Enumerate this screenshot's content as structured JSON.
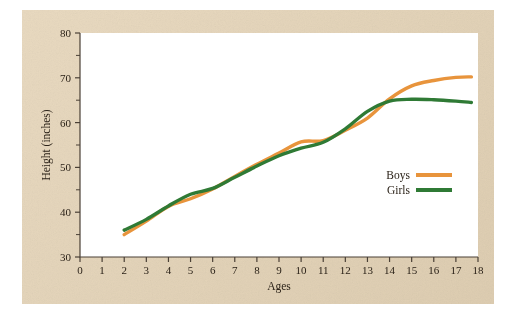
{
  "figure": {
    "panel_color": "#e6d5b8",
    "plot_background": "#ffffff",
    "axis_color": "#4a4036"
  },
  "chart_data": {
    "type": "line",
    "title": "",
    "subtitle": "",
    "xlabel": "Ages",
    "ylabel": "Height (inches)",
    "xlim": [
      0,
      18
    ],
    "ylim": [
      30,
      80
    ],
    "xticks": [
      0,
      1,
      2,
      3,
      4,
      5,
      6,
      7,
      8,
      9,
      10,
      11,
      12,
      13,
      14,
      15,
      16,
      17,
      18
    ],
    "xtick_labels": [
      "0",
      "1",
      "2",
      "3",
      "4",
      "5",
      "6",
      "7",
      "8",
      "9",
      "10",
      "11",
      "12",
      "13",
      "14",
      "15",
      "16",
      "17",
      "18"
    ],
    "yticks": [
      30,
      40,
      50,
      60,
      70,
      80
    ],
    "ytick_labels": [
      "30",
      "40",
      "50",
      "60",
      "70",
      "80"
    ],
    "y_minor_ticks": [
      35,
      45,
      55,
      65,
      75
    ],
    "grid": false,
    "legend_position": "center-right",
    "x": [
      2,
      3,
      4,
      5,
      6,
      7,
      8,
      9,
      10,
      11,
      12,
      13,
      14,
      15,
      16,
      17,
      17.7
    ],
    "series": [
      {
        "name": "Boys",
        "color": "#e8943c",
        "values": [
          35.0,
          38.0,
          41.3,
          43.0,
          45.2,
          48.0,
          50.7,
          53.2,
          55.7,
          56.0,
          58.3,
          61.0,
          65.3,
          68.2,
          69.4,
          70.1,
          70.2
        ]
      },
      {
        "name": "Girls",
        "color": "#2f7a35",
        "values": [
          36.0,
          38.4,
          41.4,
          44.0,
          45.3,
          47.8,
          50.3,
          52.6,
          54.3,
          55.6,
          58.6,
          62.5,
          64.8,
          65.2,
          65.1,
          64.8,
          64.5
        ]
      }
    ],
    "annotations": []
  },
  "legend": {
    "entries": [
      {
        "label": "Boys",
        "color": "#e8943c"
      },
      {
        "label": "Girls",
        "color": "#2f7a35"
      }
    ]
  }
}
